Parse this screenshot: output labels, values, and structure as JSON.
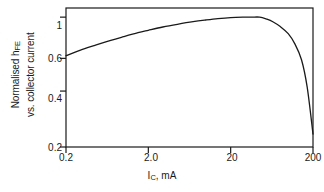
{
  "chart_data": {
    "type": "line",
    "title": "",
    "xlabel": "I_C, mA",
    "xlabel_base": "I",
    "xlabel_sub": "C",
    "xlabel_tail": ", mA",
    "ylabel_line1_base": "Normalised h",
    "ylabel_line1_sub": "FE",
    "ylabel_line2": "vs. collector current",
    "xscale": "log",
    "yscale": "log",
    "xlim": [
      0.2,
      200
    ],
    "ylim": [
      0.2,
      1.12
    ],
    "xticks": [
      0.2,
      2.0,
      20,
      200
    ],
    "xtick_labels": [
      "0.2",
      "2.0",
      "20",
      "200"
    ],
    "yticks": [
      0.2,
      0.4,
      0.6,
      1
    ],
    "ytick_labels": [
      "0.2",
      "0.4",
      "0.6",
      "1"
    ],
    "grid": false,
    "legend": "none",
    "line_color": "#1a1a1a",
    "frame_color": "#1a1a1a",
    "background": "#ffffff",
    "series": [
      {
        "name": "Normalised hFE",
        "x": [
          0.2,
          0.3,
          0.45,
          0.7,
          1.0,
          1.5,
          2.0,
          3.0,
          4.5,
          7.0,
          10.0,
          14.0,
          20.0,
          28.0,
          36.0,
          45.0,
          55.0,
          65.0,
          80.0,
          100.0,
          120.0,
          145.0,
          170.0,
          200.0
        ],
        "y": [
          0.62,
          0.665,
          0.705,
          0.75,
          0.785,
          0.825,
          0.85,
          0.885,
          0.915,
          0.945,
          0.965,
          0.982,
          0.995,
          1.0,
          1.0,
          1.0,
          0.975,
          0.945,
          0.89,
          0.815,
          0.72,
          0.59,
          0.42,
          0.235
        ]
      }
    ]
  },
  "yaxis": {
    "ticks": [
      {
        "label": "1",
        "value": 1
      },
      {
        "label": "0.6",
        "value": 0.6
      },
      {
        "label": "0.4",
        "value": 0.4
      },
      {
        "label": "0.2",
        "value": 0.2
      }
    ]
  },
  "xaxis": {
    "ticks": [
      {
        "label": "0.2",
        "value": 0.2
      },
      {
        "label": "2.0",
        "value": 2.0
      },
      {
        "label": "20",
        "value": 20
      },
      {
        "label": "200",
        "value": 200
      }
    ]
  }
}
